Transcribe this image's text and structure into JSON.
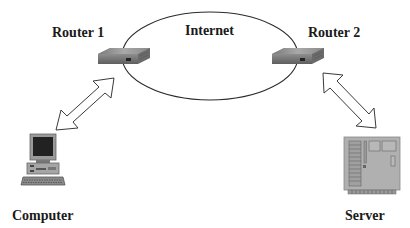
{
  "diagram": {
    "type": "network-topology",
    "nodes": [
      {
        "id": "router1",
        "label": "Router 1",
        "kind": "router-icon"
      },
      {
        "id": "internet",
        "label": "Internet",
        "kind": "cloud-ellipse"
      },
      {
        "id": "router2",
        "label": "Router 2",
        "kind": "router-icon"
      },
      {
        "id": "computer",
        "label": "Computer",
        "kind": "desktop-computer-icon"
      },
      {
        "id": "server",
        "label": "Server",
        "kind": "server-board-icon"
      }
    ],
    "edges": [
      {
        "from": "computer",
        "to": "router1",
        "style": "double-headed-hollow-arrow"
      },
      {
        "from": "router1",
        "to": "internet",
        "style": "attached-to-boundary"
      },
      {
        "from": "internet",
        "to": "router2",
        "style": "attached-to-boundary"
      },
      {
        "from": "router2",
        "to": "server",
        "style": "double-headed-hollow-arrow"
      }
    ]
  },
  "labels": {
    "router1": "Router 1",
    "internet": "Internet",
    "router2": "Router 2",
    "computer": "Computer",
    "server": "Server"
  },
  "colors": {
    "line": "#2b2b2b",
    "device_gray": "#8c8c8c",
    "device_dark": "#5a5a5a",
    "screen": "#1e1e1e",
    "text": "#1a1a1a"
  }
}
